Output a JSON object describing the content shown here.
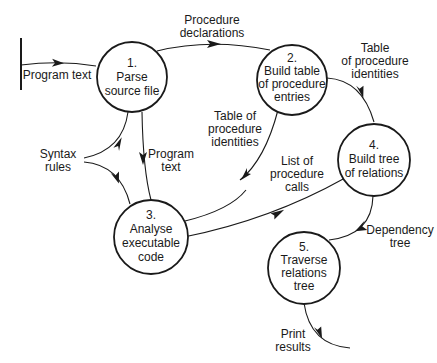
{
  "diagram": {
    "type": "data-flow-diagram",
    "colors": {
      "ink": "#1a1a1a",
      "background": "#ffffff"
    },
    "external_source": {
      "label": "Program text"
    },
    "processes": [
      {
        "id": "1",
        "number": "1.",
        "lines": [
          "Parse",
          "source file"
        ]
      },
      {
        "id": "2",
        "number": "2.",
        "lines": [
          "Build table",
          "of procedure",
          "entries"
        ]
      },
      {
        "id": "3",
        "number": "3.",
        "lines": [
          "Analyse",
          "executable",
          "code"
        ]
      },
      {
        "id": "4",
        "number": "4.",
        "lines": [
          "Build tree",
          "of relations"
        ]
      },
      {
        "id": "5",
        "number": "5.",
        "lines": [
          "Traverse",
          "relations",
          "tree"
        ]
      }
    ],
    "flows": [
      {
        "from": "source",
        "to": "1",
        "lines": [
          "Program text"
        ]
      },
      {
        "from": "1",
        "to": "2",
        "lines": [
          "Procedure",
          "declarations"
        ]
      },
      {
        "from": "2",
        "to": "4",
        "lines": [
          "Table",
          "of procedure",
          "identities"
        ]
      },
      {
        "from": "2",
        "to": "3",
        "lines": [
          "Table of",
          "procedure",
          "identities"
        ]
      },
      {
        "from": "syntax",
        "to": "1,3",
        "lines": [
          "Syntax",
          "rules"
        ]
      },
      {
        "from": "1",
        "to": "3",
        "lines": [
          "Program",
          "text"
        ]
      },
      {
        "from": "3",
        "to": "4",
        "lines": [
          "List of",
          "procedure",
          "calls"
        ]
      },
      {
        "from": "4",
        "to": "5",
        "lines": [
          "Dependency",
          "tree"
        ]
      },
      {
        "from": "5",
        "to": "output",
        "lines": [
          "Print",
          "results"
        ]
      }
    ]
  }
}
